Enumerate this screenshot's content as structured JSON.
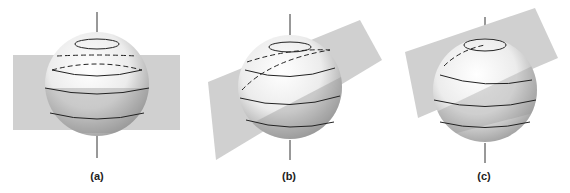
{
  "figure": {
    "panels": [
      {
        "id": "a",
        "label": "(a)",
        "plane": "horizontal plane through lower half of sphere"
      },
      {
        "id": "b",
        "label": "(b)",
        "plane": "plane tilted moderately relative to axis"
      },
      {
        "id": "c",
        "label": "(c)",
        "plane": "plane tilted steeply relative to axis"
      }
    ],
    "colors": {
      "plane": "#cfcfcf",
      "sphere_light": "#ffffff",
      "sphere_dark": "#a8a8a8",
      "lines": "#222222"
    }
  }
}
